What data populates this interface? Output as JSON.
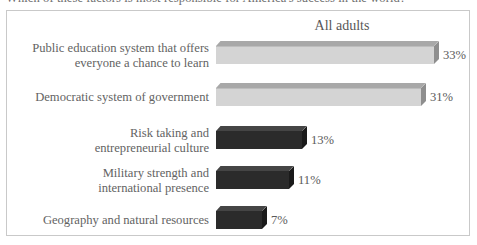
{
  "question": "Which of these factors is most responsible for America's success in the world?",
  "chart_data": {
    "type": "bar",
    "title": "All adults",
    "xlabel": "",
    "ylabel": "",
    "orientation": "horizontal",
    "grid": false,
    "legend": "none",
    "value_suffix": "%",
    "xlim": [
      0,
      36
    ],
    "categories": [
      "Public education system that offers everyone a chance to learn",
      "Democratic system of government",
      "Risk taking and entrepreneurial culture",
      "Military strength and international presence",
      "Geography and natural resources"
    ],
    "values": [
      33,
      31,
      13,
      11,
      7
    ],
    "value_labels": [
      "33%",
      "31%",
      "13%",
      "11%",
      "7%"
    ],
    "bars": [
      {
        "label_line1": "Public education system that offers",
        "label_line2": "everyone a chance to learn",
        "value": 33,
        "value_label": "33%",
        "style": "light"
      },
      {
        "label_line1": "Democratic system of government",
        "label_line2": "",
        "value": 31,
        "value_label": "31%",
        "style": "light"
      },
      {
        "label_line1": "Risk taking and",
        "label_line2": "entrepreneurial culture",
        "value": 13,
        "value_label": "13%",
        "style": "dark"
      },
      {
        "label_line1": "Military strength and",
        "label_line2": "international presence",
        "value": 11,
        "value_label": "11%",
        "style": "dark"
      },
      {
        "label_line1": "Geography and natural resources",
        "label_line2": "",
        "value": 7,
        "value_label": "7%",
        "style": "dark"
      }
    ],
    "colors": {
      "light_bar_front": "#d4d4d4",
      "light_bar_top": "#a8a8a8",
      "light_bar_side": "#8e8e8e",
      "dark_bar_front": "#2b2b2b",
      "dark_bar_top": "#454545",
      "dark_bar_side": "#1a1a1a",
      "frame_border": "#c9c9c9",
      "text": "#5f5f5f",
      "background": "#ffffff"
    }
  }
}
